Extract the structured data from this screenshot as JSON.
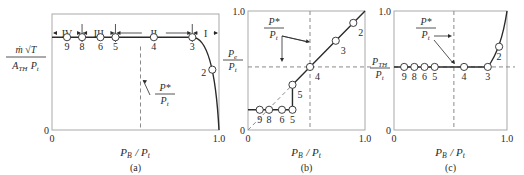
{
  "figure": {
    "panels": [
      {
        "id": "a",
        "caption": "(a)",
        "box": {
          "left": 52,
          "top": 14,
          "right": 219,
          "bottom": 130
        },
        "y_label": {
          "numerator": "ṁ √T_t",
          "denominator": "A_TH P_t"
        },
        "y_ticks": [
          {
            "label": "0",
            "value": 0
          }
        ],
        "x_ticks": [
          {
            "label": "0",
            "value": 0
          },
          {
            "label": "1.0",
            "value": 1.0
          }
        ],
        "x_label": "P_B / P_t",
        "regions": [
          {
            "label": "IV",
            "from": 0.0,
            "to": 0.18
          },
          {
            "label": "III",
            "from": 0.18,
            "to": 0.38
          },
          {
            "label": "II",
            "from": 0.38,
            "to": 0.84
          },
          {
            "label": "I",
            "from": 0.84,
            "to": 1.0
          }
        ],
        "dashed_vertical_x": 0.53,
        "annotation": {
          "numerator": "P*",
          "denominator": "P_t"
        },
        "points": [
          {
            "label": "9",
            "x": 0.09,
            "y": 0.8
          },
          {
            "label": "8",
            "x": 0.18,
            "y": 0.8
          },
          {
            "label": "6",
            "x": 0.29,
            "y": 0.8
          },
          {
            "label": "5",
            "x": 0.38,
            "y": 0.8
          },
          {
            "label": "4",
            "x": 0.61,
            "y": 0.8
          },
          {
            "label": "3",
            "x": 0.84,
            "y": 0.8
          },
          {
            "label": "2",
            "x": 0.96,
            "y": 0.52
          }
        ]
      },
      {
        "id": "b",
        "caption": "(b)",
        "box": {
          "left": 248,
          "top": 11,
          "right": 365,
          "bottom": 130
        },
        "y_label": {
          "numerator": "P_e",
          "denominator": "P_t"
        },
        "y_ticks": [
          {
            "label": "0",
            "value": 0
          },
          {
            "label": "1.0",
            "value": 1.0
          }
        ],
        "x_ticks": [
          {
            "label": "0",
            "value": 0
          },
          {
            "label": "1.0",
            "value": 1.0
          }
        ],
        "x_label": "P_B / P_t",
        "dashed_vertical_x": 0.53,
        "dashed_horizontal_y": 0.53,
        "annotation": {
          "numerator": "P*",
          "denominator": "P_t"
        },
        "points": [
          {
            "label": "9",
            "x": 0.1,
            "y": 0.17
          },
          {
            "label": "8",
            "x": 0.18,
            "y": 0.17
          },
          {
            "label": "6",
            "x": 0.29,
            "y": 0.17
          },
          {
            "label": "5",
            "x": 0.38,
            "y": 0.17
          },
          {
            "label": "5",
            "x": 0.38,
            "y": 0.38
          },
          {
            "label": "4",
            "x": 0.53,
            "y": 0.53
          },
          {
            "label": "3",
            "x": 0.75,
            "y": 0.75
          },
          {
            "label": "2",
            "x": 0.9,
            "y": 0.9
          }
        ]
      },
      {
        "id": "c",
        "caption": "(c)",
        "box": {
          "left": 394,
          "top": 11,
          "right": 507,
          "bottom": 130
        },
        "y_label": {
          "numerator": "P_TH",
          "denominator": "P_t"
        },
        "y_ticks": [
          {
            "label": "0",
            "value": 0
          },
          {
            "label": "1.0",
            "value": 1.0
          }
        ],
        "x_ticks": [
          {
            "label": "0",
            "value": 0
          },
          {
            "label": "1.0",
            "value": 1.0
          }
        ],
        "x_label": "P_B / P_t",
        "dashed_vertical_x": 0.53,
        "dashed_horizontal_y": 0.53,
        "annotation": {
          "numerator": "P*",
          "denominator": "P_t"
        },
        "points": [
          {
            "label": "9",
            "x": 0.09,
            "y": 0.53
          },
          {
            "label": "8",
            "x": 0.18,
            "y": 0.53
          },
          {
            "label": "6",
            "x": 0.27,
            "y": 0.53
          },
          {
            "label": "5",
            "x": 0.36,
            "y": 0.53
          },
          {
            "label": "4",
            "x": 0.62,
            "y": 0.53
          },
          {
            "label": "3",
            "x": 0.83,
            "y": 0.53
          },
          {
            "label": "2",
            "x": 0.93,
            "y": 0.7
          }
        ]
      }
    ]
  }
}
